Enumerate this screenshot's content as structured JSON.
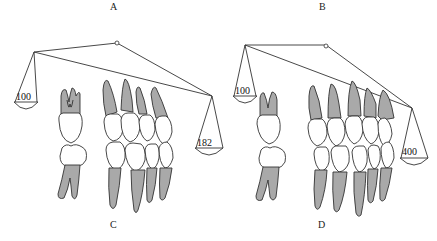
{
  "figure": {
    "panel_labels": {
      "top_left": "A",
      "top_right": "B",
      "bottom_left": "C",
      "bottom_right": "D"
    },
    "balance_left": {
      "left_weight": "100",
      "right_weight": "182"
    },
    "balance_right": {
      "left_weight": "100",
      "right_weight": "400"
    },
    "colors": {
      "root_fill": "#a9a9a9",
      "crown_fill": "#ffffff",
      "outline": "#333333",
      "background": "#ffffff"
    }
  }
}
